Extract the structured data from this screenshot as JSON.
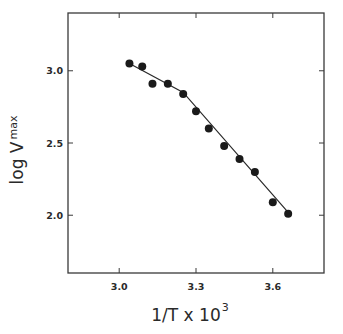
{
  "chart_data": {
    "type": "scatter",
    "title": "",
    "xlabel": "1/T x 10^3",
    "xlabel_main": "1/T x 10",
    "xlabel_sup": "3",
    "ylabel": "log V_max",
    "ylabel_main": "log V",
    "ylabel_sub": "max",
    "xlim": [
      2.8,
      3.8
    ],
    "ylim": [
      1.6,
      3.4
    ],
    "xticks": [
      3.0,
      3.3,
      3.6
    ],
    "xtick_labels": [
      "3.0",
      "3.3",
      "3.6"
    ],
    "yticks": [
      2.0,
      2.5,
      3.0
    ],
    "ytick_labels": [
      "2.0",
      "2.5",
      "3.0"
    ],
    "grid": false,
    "legend": null,
    "series": [
      {
        "name": "data",
        "marker": "filled-circle",
        "color": "#1a1a1a",
        "x": [
          3.04,
          3.09,
          3.13,
          3.19,
          3.25,
          3.3,
          3.35,
          3.41,
          3.47,
          3.53,
          3.6,
          3.66
        ],
        "y": [
          3.05,
          3.03,
          2.91,
          2.91,
          2.84,
          2.72,
          2.6,
          2.48,
          2.39,
          2.3,
          2.09,
          2.01
        ]
      },
      {
        "name": "fit",
        "style": "line",
        "color": "#1a1a1a",
        "x": [
          3.04,
          3.25,
          3.66
        ],
        "y": [
          3.05,
          2.85,
          2.02
        ]
      }
    ]
  },
  "plot": {
    "box": {
      "left": 68,
      "top": 13,
      "right": 324,
      "bottom": 273
    },
    "axis_color": "#3a3a3a",
    "marker_color": "#1a1a1a"
  }
}
